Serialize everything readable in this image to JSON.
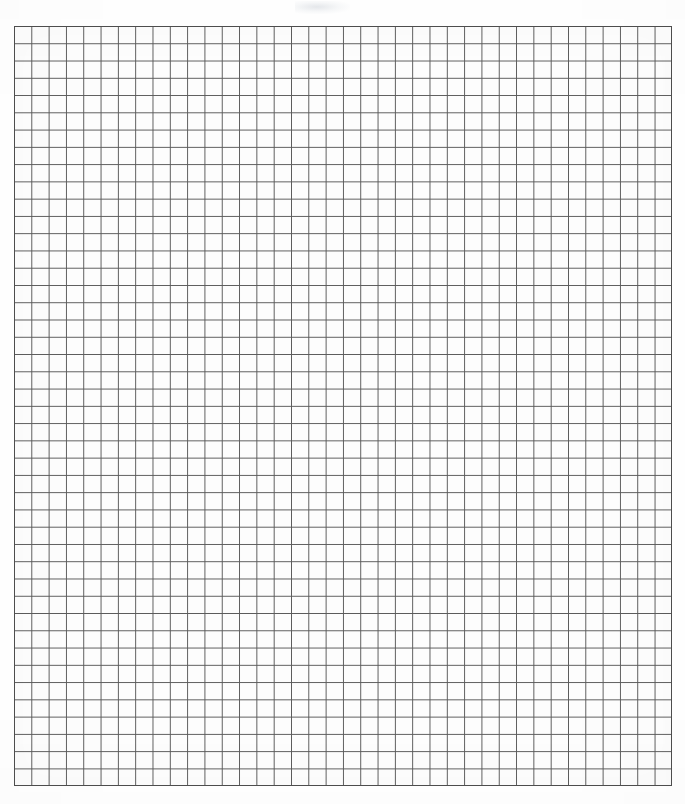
{
  "document": {
    "type": "graph-paper-scan",
    "title": "Square Grid Graph Paper",
    "description": "Blank scanned sheet of square quadrille graph paper with no markings, text, or labels",
    "page_width": 685,
    "page_height": 804,
    "background_color": "#ffffff",
    "paper_color": "#fdfdfd"
  },
  "grid": {
    "left": 14,
    "top": 26,
    "width": 658,
    "height": 760,
    "columns": 38,
    "rows": 44,
    "cell_width": 17.32,
    "cell_height": 17.27,
    "line_color": "#5a5a5a",
    "line_width": 1,
    "border_color": "#4e4e4e",
    "border_width": 1,
    "has_major_lines": false,
    "has_labels": false,
    "has_axis_ticks": false
  },
  "annotations": {
    "text_content": "",
    "markings": "none",
    "scan_artifact_present": true
  },
  "chart_data": {
    "type": "table",
    "title": "",
    "xlabel": "",
    "ylabel": "",
    "categories": [],
    "values": [],
    "grid": true,
    "legend": "none",
    "note": "Empty graph paper — no plotted data present in the image"
  }
}
